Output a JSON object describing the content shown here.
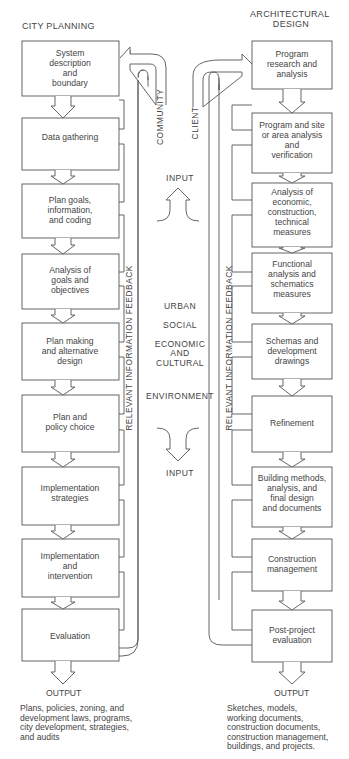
{
  "left": {
    "title": "CITY PLANNING",
    "boxes": [
      {
        "lines": [
          "System",
          "description",
          "and",
          "boundary"
        ]
      },
      {
        "lines": [
          "Data gathering"
        ]
      },
      {
        "lines": [
          "Plan goals,",
          "information,",
          "and coding"
        ]
      },
      {
        "lines": [
          "Analysis of",
          "goals and",
          "objectives"
        ]
      },
      {
        "lines": [
          "Plan making",
          "and alternative",
          "design"
        ]
      },
      {
        "lines": [
          "Plan and",
          "policy choice"
        ]
      },
      {
        "lines": [
          "Implementation",
          "strategies"
        ]
      },
      {
        "lines": [
          "Implementation",
          "and",
          "intervention"
        ]
      },
      {
        "lines": [
          "Evaluation"
        ]
      }
    ],
    "channel_label": "COMMUNITY",
    "feedback_label": "RELEVANT INFORMATION FEEDBACK",
    "output_label": "OUTPUT",
    "output_lines": [
      "Plans, policies, zoning, and",
      "development laws, programs,",
      "city development, strategies,",
      "and audits"
    ]
  },
  "right": {
    "title_lines": [
      "ARCHITECTURAL",
      "DESIGN"
    ],
    "boxes": [
      {
        "lines": [
          "Program",
          "research and",
          "analysis"
        ]
      },
      {
        "lines": [
          "Program and site",
          "or area analysis",
          "and",
          "verification"
        ]
      },
      {
        "lines": [
          "Analysis of",
          "economic,",
          "construction,",
          "technical",
          "measures"
        ]
      },
      {
        "lines": [
          "Functional",
          "analysis and",
          "schematics",
          "measures"
        ]
      },
      {
        "lines": [
          "Schemas and",
          "development",
          "drawings"
        ]
      },
      {
        "lines": [
          "Refinement"
        ]
      },
      {
        "lines": [
          "Building methods,",
          "analysis, and",
          "final design",
          "and documents"
        ]
      },
      {
        "lines": [
          "Construction",
          "management"
        ]
      },
      {
        "lines": [
          "Post-project",
          "evaluation"
        ]
      }
    ],
    "channel_label": "CLIENT",
    "feedback_label": "RELEVANT INFORMATION FEEDBACK",
    "output_label": "OUTPUT",
    "output_lines": [
      "Sketches, models,",
      "working documents,",
      "construction documents,",
      "construction management,",
      "buildings, and projects."
    ]
  },
  "center": {
    "input_top": "INPUT",
    "labels": [
      "URBAN",
      "SOCIAL",
      "ECONOMIC",
      "AND",
      "CULTURAL",
      "ENVIRONMENT"
    ],
    "input_bottom": "INPUT"
  }
}
